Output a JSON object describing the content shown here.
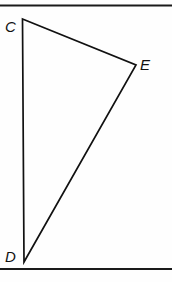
{
  "figure": {
    "name": "triangle-cde",
    "background_color": "#fefefe",
    "ink_color": "#111111",
    "rule_color": "#1a1a1a",
    "width": 172,
    "height": 282
  },
  "rules": {
    "top": {
      "name": "top-rule",
      "x1": 0,
      "y1": 5.5,
      "x2": 172,
      "y2": 5.5,
      "width": 2.2
    },
    "bottom": {
      "name": "bottom-rule",
      "x1": 0,
      "y1": 269,
      "x2": 172,
      "y2": 269,
      "width": 2.2
    }
  },
  "shape": {
    "type": "triangle",
    "path": "M 22.5 19 L 136 65 L 24 262 Z",
    "vertices": [
      {
        "id": "C",
        "label": "C",
        "x": 22.5,
        "y": 19,
        "label_x": 5,
        "label_y": 32
      },
      {
        "id": "E",
        "label": "E",
        "x": 136,
        "y": 65,
        "label_x": 140,
        "label_y": 70
      },
      {
        "id": "D",
        "label": "D",
        "x": 24,
        "y": 262,
        "label_x": 5,
        "label_y": 262
      }
    ],
    "edges": [
      {
        "id": "CE",
        "from": "C",
        "to": "E"
      },
      {
        "id": "ED",
        "from": "E",
        "to": "D"
      },
      {
        "id": "DC",
        "from": "D",
        "to": "C"
      }
    ]
  }
}
